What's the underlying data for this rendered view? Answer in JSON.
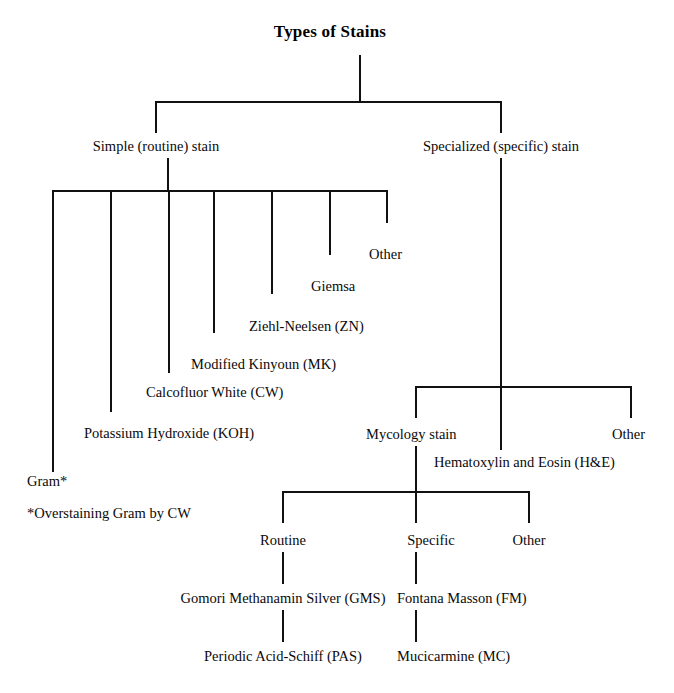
{
  "diagram": {
    "title": "Types of Stains",
    "type": "tree-hierarchy",
    "nodes": {
      "root": "Types of Stains",
      "simple_stain": "Simple (routine) stain",
      "specialized_stain": "Specialized (specific) stain",
      "simple_children": [
        "Gram*",
        "Potassium Hydroxide (KOH)",
        "Calcofluor White (CW)",
        "Modified Kinyoun (MK)",
        "Ziehl-Neelsen (ZN)",
        "Giemsa",
        "Other"
      ],
      "specialized_children": [
        "Mycology stain",
        "Hematoxylin and Eosin (H&E)",
        "Other"
      ],
      "mycology_children": [
        "Routine",
        "Specific",
        "Other"
      ],
      "routine_chain": [
        "Gomori Methanamin Silver (GMS)",
        "Periodic Acid-Schiff (PAS)"
      ],
      "specific_chain": [
        "Fontana Masson (FM)",
        "Mucicarmine (MC)"
      ]
    },
    "footnote": "*Overstaining Gram by CW",
    "colors": {
      "line": "#111111",
      "text": "#0a0a0a",
      "background": "#ffffff"
    }
  }
}
